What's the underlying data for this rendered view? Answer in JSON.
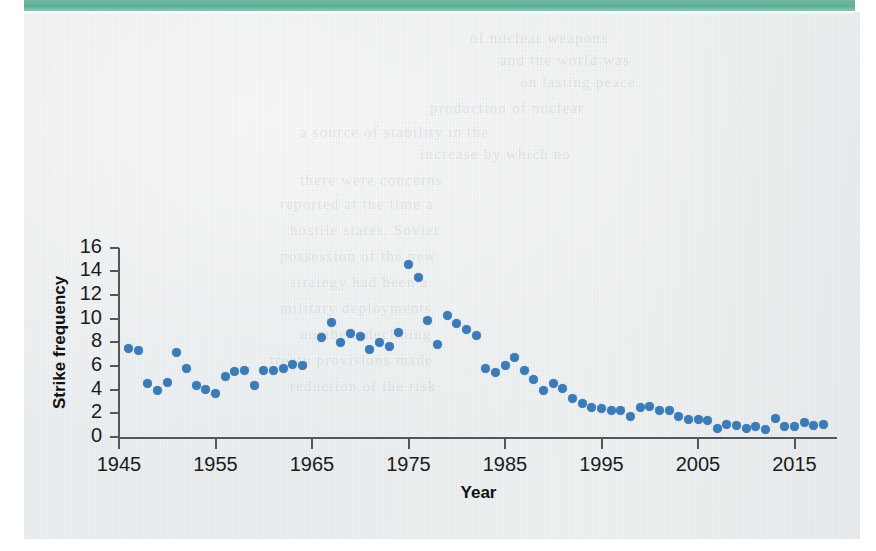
{
  "page": {
    "banner_color": "#5fae97",
    "sheet_color": "#eceff1",
    "bleed_lines": [
      {
        "text": "of nuclear weapons",
        "x": 470,
        "y": 30
      },
      {
        "text": "and the world was",
        "x": 500,
        "y": 52
      },
      {
        "text": "on lasting peace",
        "x": 520,
        "y": 74
      },
      {
        "text": "production of nuclear",
        "x": 430,
        "y": 100
      },
      {
        "text": "a source of stability in the",
        "x": 300,
        "y": 124
      },
      {
        "text": "increase by which no",
        "x": 420,
        "y": 146
      },
      {
        "text": "there were concerns",
        "x": 300,
        "y": 172
      },
      {
        "text": "reported at the time a",
        "x": 280,
        "y": 196
      },
      {
        "text": "hostile states. Soviet",
        "x": 290,
        "y": 222
      },
      {
        "text": "possession of the new",
        "x": 280,
        "y": 248
      },
      {
        "text": "strategy had been a",
        "x": 290,
        "y": 274
      },
      {
        "text": "military deployments",
        "x": 280,
        "y": 300
      },
      {
        "text": "numbers declining",
        "x": 300,
        "y": 326
      },
      {
        "text": "treaty provisions made",
        "x": 270,
        "y": 352
      },
      {
        "text": "reduction of the risk",
        "x": 290,
        "y": 378
      }
    ]
  },
  "chart_data": {
    "type": "scatter",
    "title": "",
    "xlabel": "Year",
    "ylabel": "Strike frequency",
    "xlim": [
      1944,
      2018
    ],
    "ylim": [
      0,
      16
    ],
    "grid": false,
    "legend": "none",
    "marker_color": "#3b7cb8",
    "axis_color": "#53565a",
    "xticks": [
      1945,
      1955,
      1965,
      1975,
      1985,
      1995,
      2005,
      2015
    ],
    "yticks": [
      0,
      2,
      4,
      6,
      8,
      10,
      12,
      14,
      16
    ],
    "points": [
      {
        "x": 1946,
        "y": 7.5
      },
      {
        "x": 1947,
        "y": 7.3
      },
      {
        "x": 1948,
        "y": 4.5
      },
      {
        "x": 1949,
        "y": 3.95
      },
      {
        "x": 1950,
        "y": 4.6
      },
      {
        "x": 1951,
        "y": 7.1
      },
      {
        "x": 1952,
        "y": 5.75
      },
      {
        "x": 1953,
        "y": 4.35
      },
      {
        "x": 1954,
        "y": 4.05
      },
      {
        "x": 1955,
        "y": 3.65
      },
      {
        "x": 1956,
        "y": 5.15
      },
      {
        "x": 1957,
        "y": 5.55
      },
      {
        "x": 1958,
        "y": 5.6
      },
      {
        "x": 1959,
        "y": 4.35
      },
      {
        "x": 1960,
        "y": 5.65
      },
      {
        "x": 1961,
        "y": 5.6
      },
      {
        "x": 1962,
        "y": 5.8
      },
      {
        "x": 1963,
        "y": 6.15
      },
      {
        "x": 1964,
        "y": 6.05
      },
      {
        "x": 1966,
        "y": 8.4
      },
      {
        "x": 1967,
        "y": 9.65
      },
      {
        "x": 1968,
        "y": 8.0
      },
      {
        "x": 1969,
        "y": 8.7
      },
      {
        "x": 1970,
        "y": 8.45
      },
      {
        "x": 1971,
        "y": 7.4
      },
      {
        "x": 1972,
        "y": 7.95
      },
      {
        "x": 1973,
        "y": 7.65
      },
      {
        "x": 1974,
        "y": 8.85
      },
      {
        "x": 1975,
        "y": 14.6
      },
      {
        "x": 1976,
        "y": 13.45
      },
      {
        "x": 1977,
        "y": 9.85
      },
      {
        "x": 1978,
        "y": 7.8
      },
      {
        "x": 1979,
        "y": 10.25
      },
      {
        "x": 1980,
        "y": 9.6
      },
      {
        "x": 1981,
        "y": 9.05
      },
      {
        "x": 1982,
        "y": 8.6
      },
      {
        "x": 1983,
        "y": 5.8
      },
      {
        "x": 1984,
        "y": 5.45
      },
      {
        "x": 1985,
        "y": 6.0
      },
      {
        "x": 1986,
        "y": 6.75
      },
      {
        "x": 1987,
        "y": 5.65
      },
      {
        "x": 1988,
        "y": 4.85
      },
      {
        "x": 1989,
        "y": 3.9
      },
      {
        "x": 1990,
        "y": 4.5
      },
      {
        "x": 1991,
        "y": 4.1
      },
      {
        "x": 1992,
        "y": 3.25
      },
      {
        "x": 1993,
        "y": 2.85
      },
      {
        "x": 1994,
        "y": 2.5
      },
      {
        "x": 1995,
        "y": 2.4
      },
      {
        "x": 1996,
        "y": 2.2
      },
      {
        "x": 1997,
        "y": 2.25
      },
      {
        "x": 1998,
        "y": 1.7
      },
      {
        "x": 1999,
        "y": 2.5
      },
      {
        "x": 2000,
        "y": 2.55
      },
      {
        "x": 2001,
        "y": 2.2
      },
      {
        "x": 2002,
        "y": 2.2
      },
      {
        "x": 2003,
        "y": 1.7
      },
      {
        "x": 2004,
        "y": 1.45
      },
      {
        "x": 2005,
        "y": 1.5
      },
      {
        "x": 2006,
        "y": 1.4
      },
      {
        "x": 2007,
        "y": 0.75
      },
      {
        "x": 2008,
        "y": 1.05
      },
      {
        "x": 2009,
        "y": 0.95
      },
      {
        "x": 2010,
        "y": 0.7
      },
      {
        "x": 2011,
        "y": 0.85
      },
      {
        "x": 2012,
        "y": 0.65
      },
      {
        "x": 2013,
        "y": 1.55
      },
      {
        "x": 2014,
        "y": 0.9
      },
      {
        "x": 2015,
        "y": 0.85
      },
      {
        "x": 2016,
        "y": 1.25
      },
      {
        "x": 2017,
        "y": 1.0
      },
      {
        "x": 2018,
        "y": 1.05
      }
    ]
  }
}
